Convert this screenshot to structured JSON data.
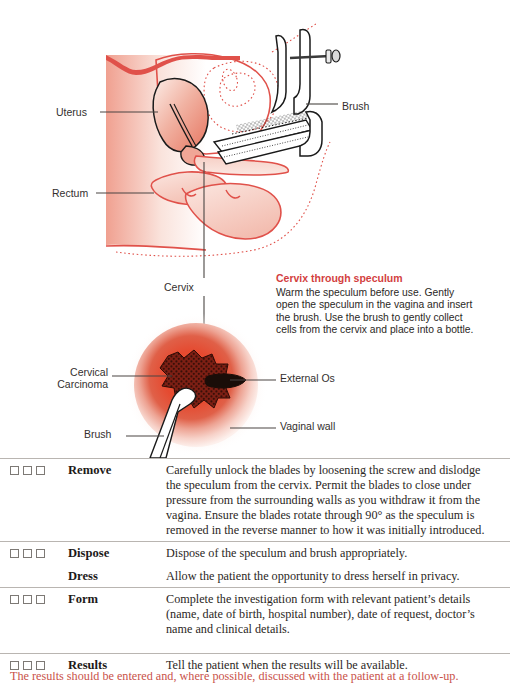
{
  "figure": {
    "labels": {
      "uterus": "Uterus",
      "rectum": "Rectum",
      "brush_top": "Brush",
      "cervix": "Cervix",
      "cervical_carcinoma": "Cervical\nCarcinoma",
      "external_os": "External Os",
      "vaginal_wall": "Vaginal wall",
      "brush_bottom": "Brush"
    },
    "sidenote": {
      "title": "Cervix through speculum",
      "body": "Warm the speculum before use. Gently open the speculum in the vagina and insert the brush. Use the brush to gently collect cells from the cervix and place into a bottle."
    },
    "colors": {
      "tissue_stroke": "#e0514a",
      "tissue_fill_light": "#f7d9d2",
      "cervix_center": "#e8432c",
      "cervix_mid": "#e2513c",
      "cervix_outer": "#f6d9d3",
      "heading_red": "#d33f3f",
      "instrument_stroke": "#1a1a1a",
      "leader_line": "#4a4543"
    }
  },
  "checklist": {
    "rows": [
      {
        "has_boxes": true,
        "checkbox_count": 3,
        "step": "Remove",
        "description": "Carefully unlock the blades by loosening the screw and dislodge the speculum from the cervix. Permit the blades to close under pressure from the surrounding walls as you withdraw it from the vagina. Ensure the blades rotate through 90° as the speculum is removed in the reverse manner to how it was initially introduced."
      },
      {
        "has_boxes": true,
        "checkbox_count": 3,
        "step": "Dispose",
        "description": "Dispose of the speculum and brush appropriately."
      },
      {
        "has_boxes": false,
        "checkbox_count": 0,
        "step": "Dress",
        "description": "Allow the patient the opportunity to dress herself in privacy."
      },
      {
        "has_boxes": true,
        "checkbox_count": 3,
        "step": "Form",
        "description": "Complete the investigation form with relevant patient’s details (name, date of birth, hospital number), date of request, doctor’s name and clinical details."
      },
      {
        "has_boxes": true,
        "checkbox_count": 3,
        "step": "Results",
        "description": "Tell the patient when the results will be available."
      }
    ]
  },
  "bottom_caption": {
    "text": "The results should be entered and, where possible, discussed with the patient at a follow-up."
  }
}
